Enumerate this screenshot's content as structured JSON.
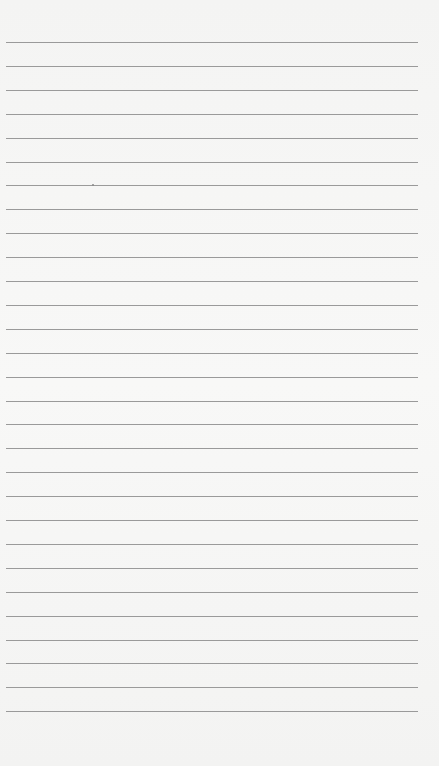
{
  "paper": {
    "type": "lined-paper",
    "line_count": 29,
    "first_line_y": 42,
    "line_spacing": 23.9,
    "line_color": "#9a9a9a",
    "background_color": "#f6f6f5"
  }
}
